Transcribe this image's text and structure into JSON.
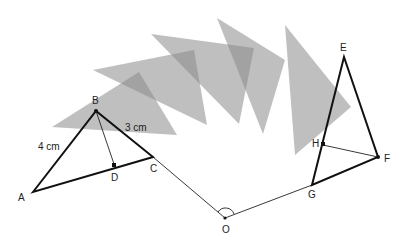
{
  "diagram": {
    "points": {
      "A": {
        "label": "A",
        "x": 33,
        "y": 192
      },
      "B": {
        "label": "B",
        "x": 96,
        "y": 111
      },
      "C": {
        "label": "C",
        "x": 153,
        "y": 157
      },
      "D": {
        "label": "D",
        "x": 115,
        "y": 167
      },
      "O": {
        "label": "O",
        "x": 225,
        "y": 218
      },
      "E": {
        "label": "E",
        "x": 344,
        "y": 57
      },
      "F": {
        "label": "F",
        "x": 378,
        "y": 157
      },
      "G": {
        "label": "G",
        "x": 312,
        "y": 185
      },
      "H": {
        "label": "H",
        "x": 323,
        "y": 145
      }
    },
    "measurements": {
      "AB": "4 cm",
      "BC": "3 cm"
    },
    "colors": {
      "shaded": "#8a8a8a",
      "line": "#111111",
      "background": "#ffffff"
    }
  }
}
